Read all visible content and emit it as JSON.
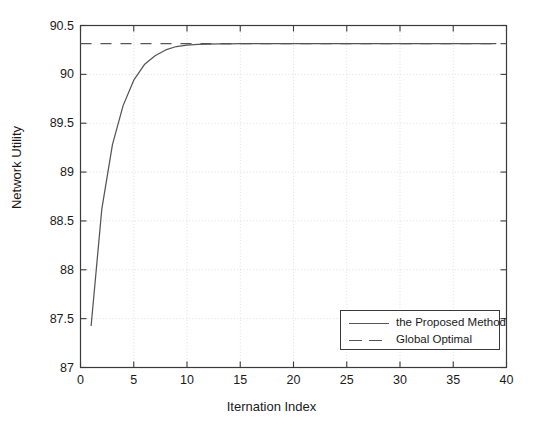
{
  "chart_data": {
    "type": "line",
    "title": "",
    "xlabel": "Iternation Index",
    "ylabel": "Network Utility",
    "xlim": [
      0,
      40
    ],
    "ylim": [
      87,
      90.5
    ],
    "xticks": [
      "0",
      "5",
      "10",
      "15",
      "20",
      "25",
      "30",
      "35",
      "40"
    ],
    "xtick_values": [
      0,
      5,
      10,
      15,
      20,
      25,
      30,
      35,
      40
    ],
    "yticks": [
      "87",
      "87.5",
      "88",
      "88.5",
      "89",
      "89.5",
      "90",
      "90.5"
    ],
    "ytick_values": [
      87,
      87.5,
      88,
      88.5,
      89,
      89.5,
      90,
      90.5
    ],
    "grid": true,
    "legend_position": "lower right",
    "series": [
      {
        "name": "the Proposed Method",
        "style": "solid",
        "color": "#555555",
        "x": [
          1,
          2,
          3,
          4,
          5,
          6,
          7,
          8,
          9,
          10,
          11,
          12,
          13,
          14,
          15,
          16,
          17,
          18,
          19,
          20,
          21,
          22,
          23,
          24,
          25,
          26,
          27,
          28,
          29,
          30,
          31,
          32,
          33,
          34,
          35,
          36,
          37,
          38,
          39
        ],
        "values": [
          87.43,
          88.62,
          89.28,
          89.68,
          89.94,
          90.1,
          90.19,
          90.25,
          90.285,
          90.3,
          90.307,
          90.31,
          90.312,
          90.313,
          90.314,
          90.314,
          90.315,
          90.315,
          90.315,
          90.315,
          90.315,
          90.315,
          90.315,
          90.315,
          90.315,
          90.315,
          90.315,
          90.315,
          90.315,
          90.315,
          90.315,
          90.315,
          90.315,
          90.315,
          90.315,
          90.315,
          90.315,
          90.315,
          90.315
        ]
      },
      {
        "name": "Global Optimal",
        "style": "dashed",
        "color": "#555555",
        "x": [
          0,
          40
        ],
        "values": [
          90.315,
          90.315
        ]
      }
    ]
  },
  "legend": {
    "entries": [
      {
        "label": "the Proposed Method"
      },
      {
        "label": "Global Optimal"
      }
    ]
  },
  "colors": {
    "line": "#555555",
    "axis": "#3a3a3a",
    "grid": "#c8c8c8",
    "text": "#1a1a1a",
    "background": "#ffffff"
  }
}
